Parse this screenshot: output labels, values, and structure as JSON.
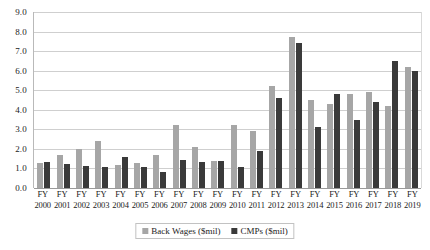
{
  "chart_data": {
    "type": "bar",
    "title": "",
    "subtitle": "",
    "xlabel": "",
    "ylabel": "",
    "ylim": [
      0.0,
      9.0
    ],
    "ytick_step": 1.0,
    "grid": true,
    "legend_position": "bottom",
    "orientation": "vertical",
    "grouping": "clustered",
    "yticks": [
      "9.0",
      "8.0",
      "7.0",
      "6.0",
      "5.0",
      "4.0",
      "3.0",
      "2.0",
      "1.0",
      "0.0"
    ],
    "ytick_values": [
      9.0,
      8.0,
      7.0,
      6.0,
      5.0,
      4.0,
      3.0,
      2.0,
      1.0,
      0.0
    ],
    "categories": [
      "FY 2000",
      "FY 2001",
      "FY 2002",
      "FY 2003",
      "FY 2004",
      "FY 2005",
      "FY 2006",
      "FY 2007",
      "FY 2008",
      "FY 2009",
      "FY 2010",
      "FY 2011",
      "FY 2012",
      "FY 2013",
      "FY 2014",
      "FY 2015",
      "FY 2016",
      "FY 2017",
      "FY 2018",
      "FY 2019"
    ],
    "category_lines": [
      {
        "fy": "FY",
        "year": "2000"
      },
      {
        "fy": "FY",
        "year": "2001"
      },
      {
        "fy": "FY",
        "year": "2002"
      },
      {
        "fy": "FY",
        "year": "2003"
      },
      {
        "fy": "FY",
        "year": "2004"
      },
      {
        "fy": "FY",
        "year": "2005"
      },
      {
        "fy": "FY",
        "year": "2006"
      },
      {
        "fy": "FY",
        "year": "2007"
      },
      {
        "fy": "FY",
        "year": "2008"
      },
      {
        "fy": "FY",
        "year": "2009"
      },
      {
        "fy": "FY",
        "year": "2010"
      },
      {
        "fy": "FY",
        "year": "2011"
      },
      {
        "fy": "FY",
        "year": "2012"
      },
      {
        "fy": "FY",
        "year": "2013"
      },
      {
        "fy": "FY",
        "year": "2014"
      },
      {
        "fy": "FY",
        "year": "2015"
      },
      {
        "fy": "FY",
        "year": "2016"
      },
      {
        "fy": "FY",
        "year": "2017"
      },
      {
        "fy": "FY",
        "year": "2018"
      },
      {
        "fy": "FY",
        "year": "2019"
      }
    ],
    "series": [
      {
        "name": "Back Wages ($mil)",
        "color": "#a6a6a6",
        "values": [
          1.3,
          1.7,
          2.0,
          2.4,
          1.2,
          1.3,
          1.7,
          3.2,
          2.1,
          1.4,
          3.2,
          2.9,
          5.2,
          7.7,
          4.5,
          4.3,
          4.8,
          4.9,
          4.2,
          6.2
        ]
      },
      {
        "name": "CMPs ($mil)",
        "color": "#3a3a3a",
        "values": [
          1.35,
          1.25,
          1.15,
          1.1,
          1.6,
          1.05,
          0.8,
          1.45,
          1.35,
          1.4,
          1.1,
          1.9,
          4.6,
          7.4,
          3.1,
          4.8,
          3.5,
          4.4,
          6.5,
          6.0
        ]
      }
    ]
  },
  "legend": {
    "items": [
      {
        "label": "Back Wages ($mil)",
        "color": "#a6a6a6"
      },
      {
        "label": "CMPs ($mil)",
        "color": "#3a3a3a"
      }
    ]
  },
  "colors": {
    "back_wages": "#a6a6a6",
    "cmps": "#3a3a3a",
    "gridline": "#cfcfcf",
    "axis": "#9a9a9a",
    "background": "#ffffff",
    "text": "#1b1b1b"
  }
}
